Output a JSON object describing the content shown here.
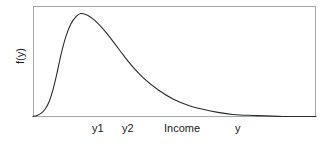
{
  "chart_data": {
    "type": "line",
    "title": "",
    "xlabel": "Income",
    "ylabel": "f(y)",
    "grid": false,
    "legend": false,
    "axis_labels_visible": [
      "y1",
      "y2",
      "Income",
      "y"
    ],
    "x_tick_labels": [
      {
        "text": "y1",
        "x_px": 65
      },
      {
        "text": "y2",
        "x_px": 95
      },
      {
        "text": "Income",
        "x_px": 149
      },
      {
        "text": "y",
        "x_px": 205
      }
    ],
    "xlim": [
      0,
      283
    ],
    "ylim": [
      0,
      111
    ],
    "series": [
      {
        "name": "income density",
        "description": "right-skewed unimodal probability density of income",
        "points": [
          {
            "x": 0,
            "y": 0
          },
          {
            "x": 4,
            "y": 1
          },
          {
            "x": 8,
            "y": 3
          },
          {
            "x": 12,
            "y": 7
          },
          {
            "x": 16,
            "y": 14
          },
          {
            "x": 20,
            "y": 26
          },
          {
            "x": 24,
            "y": 42
          },
          {
            "x": 28,
            "y": 60
          },
          {
            "x": 33,
            "y": 78
          },
          {
            "x": 38,
            "y": 90
          },
          {
            "x": 43,
            "y": 97
          },
          {
            "x": 48,
            "y": 100
          },
          {
            "x": 55,
            "y": 98
          },
          {
            "x": 62,
            "y": 93
          },
          {
            "x": 70,
            "y": 85
          },
          {
            "x": 80,
            "y": 73
          },
          {
            "x": 90,
            "y": 60
          },
          {
            "x": 100,
            "y": 48
          },
          {
            "x": 112,
            "y": 36
          },
          {
            "x": 125,
            "y": 26
          },
          {
            "x": 140,
            "y": 17
          },
          {
            "x": 155,
            "y": 11
          },
          {
            "x": 170,
            "y": 7
          },
          {
            "x": 185,
            "y": 4
          },
          {
            "x": 200,
            "y": 2
          },
          {
            "x": 220,
            "y": 1
          },
          {
            "x": 250,
            "y": 0
          },
          {
            "x": 283,
            "y": 0
          }
        ],
        "peak": {
          "x": 48,
          "y": 100
        }
      }
    ],
    "colors": {
      "curve": "#2b2b2b",
      "frame": "#a8a8a8",
      "background": "#ffffff",
      "text": "#1a1a1a"
    }
  }
}
